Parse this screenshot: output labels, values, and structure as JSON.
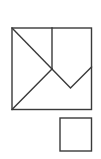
{
  "diagram": {
    "stroke_color": "#3a3a3a",
    "background_color": "#ffffff",
    "shapes": [
      {
        "id": "large-square",
        "kind": "square"
      },
      {
        "id": "vertical-divider",
        "kind": "line"
      },
      {
        "id": "diagonal-top-left",
        "kind": "line"
      },
      {
        "id": "diagonal-bottom-left",
        "kind": "line"
      },
      {
        "id": "v-notch",
        "kind": "polyline"
      },
      {
        "id": "small-square",
        "kind": "square"
      }
    ]
  }
}
